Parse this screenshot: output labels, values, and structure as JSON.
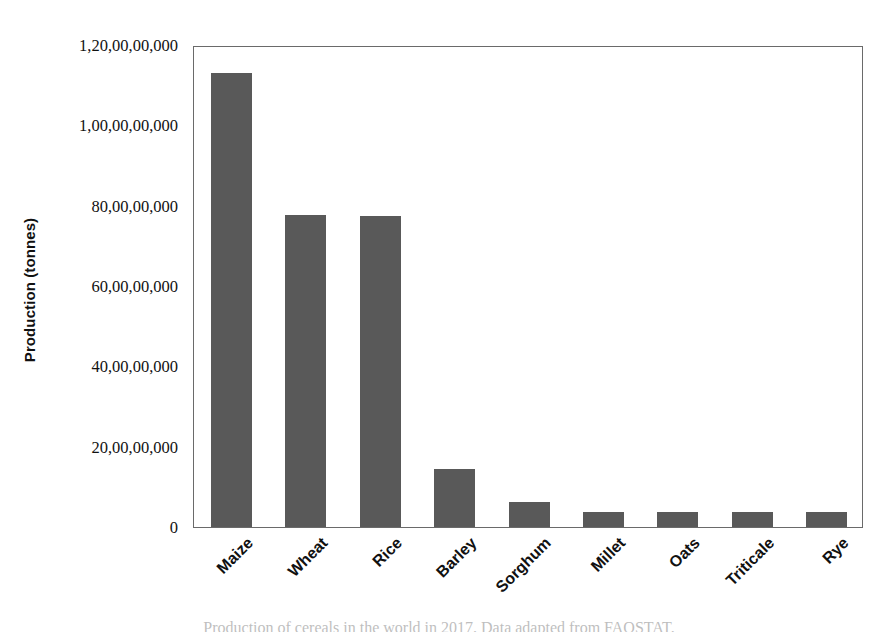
{
  "chart_data": {
    "type": "bar",
    "title": "",
    "subtitle": "",
    "xlabel": "",
    "ylabel": "Production (tonnes)",
    "categories": [
      "Maize",
      "Wheat",
      "Rice",
      "Barley",
      "Sorghum",
      "Millet",
      "Oats",
      "Triticale",
      "Rye"
    ],
    "values": [
      1130000000,
      776000000,
      775000000,
      145000000,
      62000000,
      37000000,
      37000000,
      37000000,
      37000000
    ],
    "series": [
      {
        "name": "Production",
        "values": [
          1130000000,
          776000000,
          775000000,
          145000000,
          62000000,
          37000000,
          37000000,
          37000000,
          37000000
        ]
      }
    ],
    "ylim": [
      0,
      1200000000
    ],
    "xlim": [
      0,
      9
    ],
    "ytick_values": [
      0,
      200000000,
      400000000,
      600000000,
      800000000,
      1000000000,
      1200000000
    ],
    "ytick_labels": [
      "0",
      "20,00,00,000",
      "40,00,00,000",
      "60,00,00,000",
      "80,00,00,000",
      "1,00,00,00,000",
      "1,20,00,00,000"
    ],
    "grid": false,
    "legend": false,
    "legend_position": "none",
    "bar_color": "#595959",
    "frame_color": "#6a6a6a",
    "background_color": "#ffffff",
    "xtick_label_rotation": -45,
    "number_format": "indian-grouping"
  },
  "caption": {
    "text": "Production of cereals in the world in 2017. Data adapted from FAOSTAT."
  }
}
